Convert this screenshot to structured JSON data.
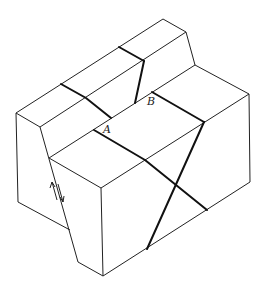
{
  "figure": {
    "labels": {
      "point_a": "A",
      "point_b": "B"
    },
    "fault_motion_symbol": "opposing half-arrows indicating fault slip"
  }
}
